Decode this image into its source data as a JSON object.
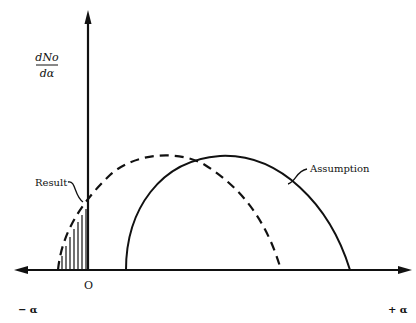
{
  "diagram": {
    "type": "distribution-curves",
    "y_axis_label": {
      "numerator": "dNo",
      "denominator": "dα"
    },
    "x_axis": {
      "left_label": "− α",
      "right_label": "+ α",
      "origin_label": "O"
    },
    "curves": [
      {
        "name": "Result",
        "style": "dashed",
        "label": "Result",
        "note": "portion left of origin is shaded (hatched)"
      },
      {
        "name": "Assumption",
        "style": "solid",
        "label": "Assumption"
      }
    ],
    "colors": {
      "ink": "#111111",
      "background": "#ffffff"
    }
  }
}
